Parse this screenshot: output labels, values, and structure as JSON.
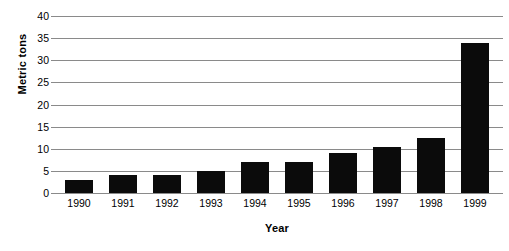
{
  "chart_data": {
    "type": "bar",
    "title": "",
    "xlabel": "Year",
    "ylabel": "Metric tons",
    "categories": [
      "1990",
      "1991",
      "1992",
      "1993",
      "1994",
      "1995",
      "1996",
      "1997",
      "1998",
      "1999"
    ],
    "values": [
      3,
      4,
      4,
      5,
      7,
      7,
      9,
      10.5,
      12.5,
      34
    ],
    "ylim": [
      0,
      40
    ],
    "yticks": [
      0,
      5,
      10,
      15,
      20,
      25,
      30,
      35,
      40
    ],
    "ytick_labels": [
      "0",
      "5",
      "10",
      "15",
      "20",
      "25",
      "30",
      "35",
      "40"
    ],
    "grid": true,
    "legend": false,
    "bar_color": "#0b0b0b",
    "gridline_color": "#8a8a8a",
    "background_color": "#ffffff"
  }
}
